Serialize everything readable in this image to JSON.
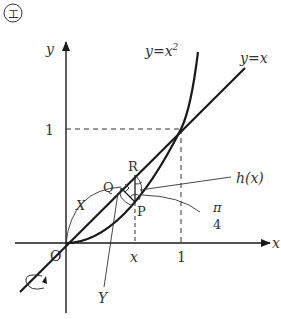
{
  "figure": {
    "marker": "エ",
    "axes": {
      "x_label": "x",
      "y_label": "y",
      "origin_label": "O",
      "tick_x_one": "1",
      "tick_y_one": "1",
      "tick_x_var": "x"
    },
    "curves": {
      "line_label": "y=x",
      "parabola_label_base": "y=x",
      "parabola_label_exp": "2"
    },
    "points": {
      "P": "P",
      "Q": "Q",
      "R": "R"
    },
    "annotations": {
      "X": "X",
      "Y": "Y",
      "h": "h(x)",
      "angle_num": "π",
      "angle_den": "4"
    },
    "colors": {
      "ink": "#1a1a1a",
      "label": "#333333"
    }
  }
}
